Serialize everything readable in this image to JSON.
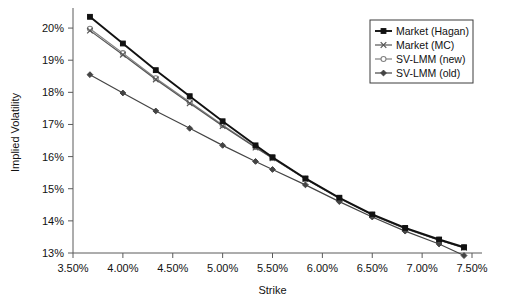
{
  "chart_data": {
    "type": "line",
    "title": "",
    "xlabel": "Strike",
    "ylabel": "Implied Volatility",
    "xlim": [
      3.5,
      7.5
    ],
    "ylim": [
      13,
      20.5
    ],
    "xtick_labels": [
      "3.50%",
      "4.00%",
      "4.50%",
      "5.00%",
      "5.50%",
      "6.00%",
      "6.50%",
      "7.00%",
      "7.50%"
    ],
    "xtick_values": [
      3.5,
      4.0,
      4.5,
      5.0,
      5.5,
      6.0,
      6.5,
      7.0,
      7.5
    ],
    "ytick_labels": [
      "13%",
      "14%",
      "15%",
      "16%",
      "17%",
      "18%",
      "19%",
      "20%"
    ],
    "ytick_values": [
      13,
      14,
      15,
      16,
      17,
      18,
      19,
      20
    ],
    "grid": false,
    "legend_position": "top-right",
    "x": [
      3.67,
      4.0,
      4.33,
      4.67,
      5.0,
      5.33,
      5.5,
      5.83,
      6.17,
      6.5,
      6.83,
      7.17,
      7.42
    ],
    "series": [
      {
        "name": "Market (Hagan)",
        "marker": "filled-square",
        "color": "#111111",
        "values": [
          20.35,
          19.52,
          18.69,
          17.88,
          17.1,
          16.35,
          15.98,
          15.32,
          14.72,
          14.2,
          13.78,
          13.42,
          13.18
        ]
      },
      {
        "name": "Market (MC)",
        "marker": "cross",
        "color": "#555555",
        "values": [
          19.92,
          19.17,
          18.4,
          17.66,
          16.95,
          16.28,
          15.95,
          15.3,
          14.7,
          14.18,
          13.76,
          13.4,
          13.16
        ]
      },
      {
        "name": "SV-LMM (new)",
        "marker": "open-circle",
        "color": "#808080",
        "values": [
          19.98,
          19.22,
          18.44,
          17.7,
          16.98,
          16.3,
          15.96,
          15.31,
          14.71,
          14.19,
          13.77,
          13.41,
          13.17
        ]
      },
      {
        "name": "SV-LMM (old)",
        "marker": "filled-diamond",
        "color": "#444444",
        "values": [
          18.55,
          17.98,
          17.42,
          16.88,
          16.35,
          15.85,
          15.6,
          15.12,
          14.6,
          14.12,
          13.68,
          13.28,
          12.92
        ]
      }
    ]
  },
  "legend": {
    "entries": [
      {
        "label": "Market (Hagan)"
      },
      {
        "label": "Market (MC)"
      },
      {
        "label": "SV-LMM (new)"
      },
      {
        "label": "SV-LMM (old)"
      }
    ]
  }
}
